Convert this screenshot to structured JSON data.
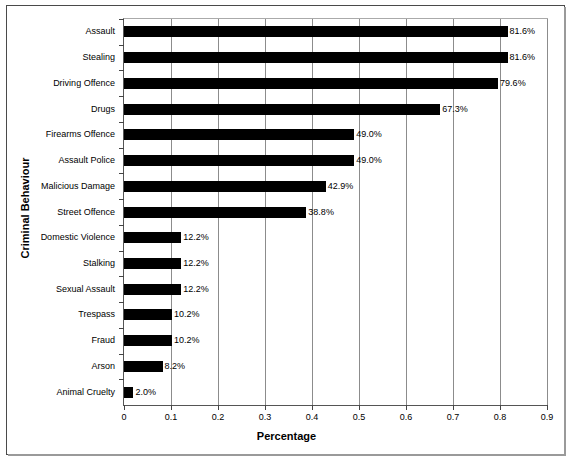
{
  "chart_data": {
    "type": "bar",
    "orientation": "horizontal",
    "title": "",
    "xlabel": "Percentage",
    "ylabel": "Criminal Behaviour",
    "xlim": [
      0,
      0.9
    ],
    "xticks": [
      "0",
      "0.1",
      "0.2",
      "0.3",
      "0.4",
      "0.5",
      "0.6",
      "0.7",
      "0.8",
      "0.9"
    ],
    "xtick_values": [
      0,
      0.1,
      0.2,
      0.3,
      0.4,
      0.5,
      0.6,
      0.7,
      0.8,
      0.9
    ],
    "grid": "vertical",
    "legend": "none",
    "bar_color": "#000000",
    "categories": [
      "Assault",
      "Stealing",
      "Driving Offence",
      "Drugs",
      "Firearms Offence",
      "Assault Police",
      "Malicious Damage",
      "Street Offence",
      "Domestic Violence",
      "Stalking",
      "Sexual Assault",
      "Trespass",
      "Fraud",
      "Arson",
      "Animal Cruelty"
    ],
    "values": [
      0.816,
      0.816,
      0.796,
      0.673,
      0.49,
      0.49,
      0.429,
      0.388,
      0.122,
      0.122,
      0.122,
      0.102,
      0.102,
      0.082,
      0.02
    ],
    "data_labels": [
      "81.6%",
      "81.6%",
      "79.6%",
      "67.3%",
      "49.0%",
      "49.0%",
      "42.9%",
      "38.8%",
      "12.2%",
      "12.2%",
      "12.2%",
      "10.2%",
      "10.2%",
      "8.2%",
      "2.0%"
    ]
  }
}
